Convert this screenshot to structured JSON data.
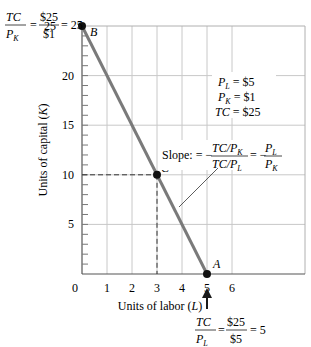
{
  "chart_data": {
    "type": "line",
    "title": "",
    "xlabel": "Units of labor (L)",
    "ylabel": "Units of capital (K)",
    "xlabel_text": "Units of labor (",
    "xlabel_var": "L",
    "ylabel_text": "Units of capital (",
    "ylabel_var": "K",
    "xlim": [
      0,
      9
    ],
    "ylim": [
      0,
      25
    ],
    "x_ticks": [
      0,
      1,
      2,
      3,
      4,
      5,
      6
    ],
    "x_tick_labels": [
      "0",
      "1",
      "2",
      "3",
      "4",
      "5",
      "6"
    ],
    "y_ticks": [
      5,
      10,
      15,
      20,
      25
    ],
    "y_tick_labels": [
      "5",
      "10",
      "15",
      "20",
      "25"
    ],
    "y_minor_tick_step": 1,
    "grid": true,
    "grid_x": [
      1,
      2,
      3,
      4,
      5,
      6
    ],
    "grid_y": [
      5,
      10,
      15,
      20
    ],
    "series": [
      {
        "name": "Isocost line",
        "color": "#7a7a7a",
        "x": [
          0,
          5
        ],
        "y": [
          25,
          0
        ]
      }
    ],
    "points": [
      {
        "label": "B",
        "x": 0,
        "y": 25
      },
      {
        "label": "C",
        "x": 3,
        "y": 10
      },
      {
        "label": "A",
        "x": 5,
        "y": 0
      }
    ],
    "dashed_guides": {
      "x": 3,
      "y": 10
    },
    "annotations": {
      "prices": [
        {
          "var": "P",
          "sub": "L",
          "value": " = $5"
        },
        {
          "var": "P",
          "sub": "K",
          "value": " = $1"
        },
        {
          "var": "TC",
          "sub": "",
          "value": " = $25"
        }
      ],
      "slope": {
        "label": "Slope: = −",
        "num": "TC/P",
        "num_sub": "K",
        "den": "TC/P",
        "den_sub": "L",
        "eq": "= −",
        "rnum": "P",
        "rnum_sub": "L",
        "rden": "P",
        "rden_sub": "K"
      },
      "k_intercept": {
        "num": "TC",
        "den": "P",
        "den_sub": "K",
        "eq1": "=",
        "num2": "$25",
        "den2": "$1",
        "eq2": "= 25"
      },
      "l_intercept": {
        "num": "TC",
        "den": "P",
        "den_sub": "L",
        "eq1": "=",
        "num2": "$25",
        "den2": "$5",
        "eq2": "= 5"
      }
    }
  }
}
